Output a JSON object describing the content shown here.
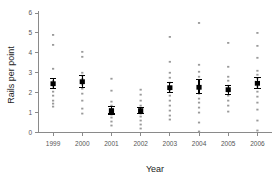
{
  "chart_data": {
    "type": "scatter",
    "title": "",
    "xlabel": "Year",
    "ylabel": "Rails per point",
    "categories": [
      "1999",
      "2000",
      "2001",
      "2002",
      "2003",
      "2004",
      "2005",
      "2006"
    ],
    "ylim": [
      0,
      6
    ],
    "yticks": [
      0,
      1,
      2,
      3,
      4,
      5,
      6
    ],
    "ytick_labels": [
      "0",
      "1",
      "2",
      "3",
      "4",
      "5",
      "6"
    ],
    "grid": false,
    "legend": "none",
    "marker_style": "mean-with-error-bars-over-raw-points",
    "series": [
      {
        "name": "Mean rails per point",
        "values": [
          2.45,
          2.55,
          1.1,
          1.1,
          2.25,
          2.27,
          2.15,
          2.47
        ],
        "error_upper": [
          2.72,
          2.88,
          1.3,
          1.27,
          2.5,
          2.67,
          2.38,
          2.78
        ],
        "error_lower": [
          2.2,
          2.28,
          0.93,
          0.95,
          2.0,
          1.95,
          1.92,
          2.2
        ]
      }
    ],
    "raw_points": {
      "1999": [
        4.9,
        4.4,
        3.2,
        2.6,
        2.45,
        2.3,
        2.05,
        1.85,
        1.6,
        1.45,
        1.3
      ],
      "2000": [
        4.05,
        3.8,
        3.0,
        2.85,
        2.7,
        2.55,
        2.4,
        2.2,
        1.95,
        1.6,
        1.2,
        0.95
      ],
      "2001": [
        2.7,
        2.1,
        1.55,
        1.35,
        1.15,
        1.05,
        0.9,
        0.75,
        0.55,
        0.35
      ],
      "2002": [
        2.15,
        1.9,
        1.6,
        1.35,
        1.15,
        1.05,
        0.95,
        0.8,
        0.6,
        0.4,
        0.2
      ],
      "2003": [
        4.8,
        3.55,
        3.0,
        2.75,
        2.5,
        2.3,
        2.1,
        1.85,
        1.6,
        1.35,
        1.1,
        0.85,
        0.65
      ],
      "2004": [
        5.5,
        3.4,
        3.05,
        2.8,
        2.55,
        2.35,
        2.15,
        1.95,
        1.7,
        1.5,
        1.25,
        1.0,
        0.5,
        0.05
      ],
      "2005": [
        4.5,
        3.3,
        2.8,
        2.6,
        2.35,
        2.2,
        2.05,
        1.85,
        1.6,
        1.35,
        1.05
      ],
      "2006": [
        5.0,
        4.35,
        3.75,
        3.1,
        2.9,
        2.7,
        2.5,
        2.3,
        2.05,
        1.8,
        1.5,
        1.15,
        0.6,
        0.1
      ]
    }
  },
  "axis": {
    "y_title": "Rails per point",
    "x_title": "Year"
  }
}
